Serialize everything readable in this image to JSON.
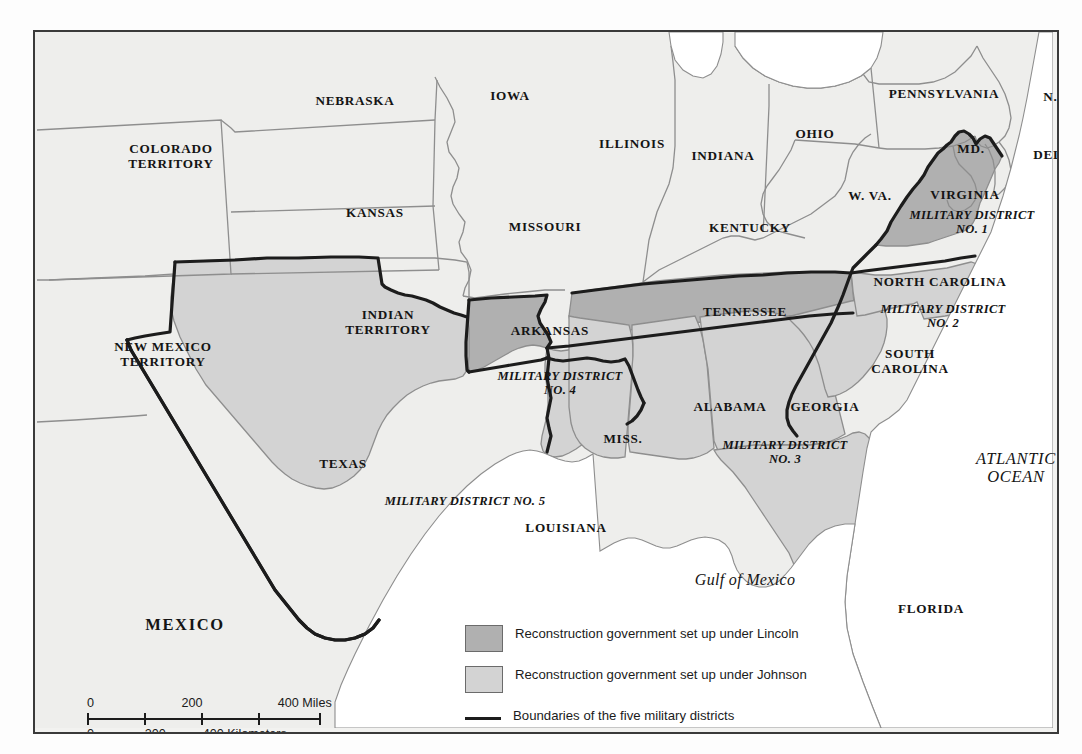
{
  "map": {
    "regions": [
      {
        "name": "colorado-territory",
        "label": "COLORADO\nTERRITORY",
        "x": 66,
        "y": 110,
        "w": 140,
        "cls": "st"
      },
      {
        "name": "nebraska",
        "label": "NEBRASKA",
        "x": 260,
        "y": 62,
        "w": 120,
        "cls": "st"
      },
      {
        "name": "iowa",
        "label": "IOWA",
        "x": 435,
        "y": 57,
        "w": 80,
        "cls": "st"
      },
      {
        "name": "kansas",
        "label": "KANSAS",
        "x": 288,
        "y": 174,
        "w": 104,
        "cls": "st"
      },
      {
        "name": "missouri",
        "label": "MISSOURI",
        "x": 455,
        "y": 188,
        "w": 110,
        "cls": "st"
      },
      {
        "name": "illinois",
        "label": "ILLINOIS",
        "x": 545,
        "y": 105,
        "w": 104,
        "cls": "st"
      },
      {
        "name": "indiana",
        "label": "INDIANA",
        "x": 636,
        "y": 117,
        "w": 104,
        "cls": "st"
      },
      {
        "name": "ohio",
        "x": 740,
        "y": 95,
        "label": "OHIO",
        "w": 80,
        "cls": "st"
      },
      {
        "name": "pennsylvania",
        "label": "PENNSYLVANIA",
        "x": 834,
        "y": 55,
        "w": 150,
        "cls": "st"
      },
      {
        "name": "new-jersey",
        "label": "N.J.",
        "x": 995,
        "y": 58,
        "w": 52,
        "cls": "st"
      },
      {
        "name": "maryland",
        "label": "MD.",
        "x": 910,
        "y": 110,
        "w": 52,
        "cls": "st"
      },
      {
        "name": "delaware",
        "label": "DEL.",
        "x": 988,
        "y": 116,
        "w": 54,
        "cls": "st"
      },
      {
        "name": "west-virginia",
        "label": "W. VA.",
        "x": 800,
        "y": 157,
        "w": 70,
        "cls": "st"
      },
      {
        "name": "virginia",
        "label": "VIRGINIA",
        "x": 880,
        "y": 156,
        "w": 100,
        "cls": "st"
      },
      {
        "name": "kentucky",
        "label": "KENTUCKY",
        "x": 655,
        "y": 189,
        "w": 120,
        "cls": "st"
      },
      {
        "name": "new-mexico-territory",
        "label": "NEW MEXICO\nTERRITORY",
        "x": 58,
        "y": 308,
        "w": 140,
        "cls": "st"
      },
      {
        "name": "indian-territory",
        "label": "INDIAN\nTERRITORY",
        "x": 288,
        "y": 276,
        "w": 130,
        "cls": "st"
      },
      {
        "name": "arkansas",
        "label": "ARKANSAS",
        "x": 455,
        "y": 292,
        "w": 120,
        "cls": "st"
      },
      {
        "name": "tennessee",
        "label": "TENNESSEE",
        "x": 640,
        "y": 273,
        "w": 140,
        "cls": "st"
      },
      {
        "name": "north-carolina",
        "label": "NORTH CAROLINA",
        "x": 820,
        "y": 243,
        "w": 170,
        "cls": "st"
      },
      {
        "name": "south-carolina",
        "label": "SOUTH\nCAROLINA",
        "x": 820,
        "y": 315,
        "w": 110,
        "cls": "st"
      },
      {
        "name": "texas",
        "label": "TEXAS",
        "x": 260,
        "y": 425,
        "w": 96,
        "cls": "st"
      },
      {
        "name": "louisiana",
        "label": "LOUISIANA",
        "x": 470,
        "y": 489,
        "w": 122,
        "cls": "st"
      },
      {
        "name": "mississippi",
        "label": "MISS.",
        "x": 555,
        "y": 400,
        "w": 66,
        "cls": "st"
      },
      {
        "name": "alabama",
        "label": "ALABAMA",
        "x": 640,
        "y": 368,
        "w": 110,
        "cls": "st"
      },
      {
        "name": "georgia",
        "label": "GEORGIA",
        "x": 738,
        "y": 368,
        "w": 104,
        "cls": "st"
      },
      {
        "name": "florida",
        "label": "FLORIDA",
        "x": 845,
        "y": 570,
        "w": 102,
        "cls": "st"
      }
    ],
    "districts": [
      {
        "name": "military-district-1",
        "label": "MILITARY DISTRICT\nNO. 1",
        "x": 872,
        "y": 176,
        "w": 130
      },
      {
        "name": "military-district-2",
        "label": "MILITARY DISTRICT\nNO. 2",
        "x": 838,
        "y": 270,
        "w": 140
      },
      {
        "name": "military-district-3",
        "label": "MILITARY DISTRICT\nNO. 3",
        "x": 675,
        "y": 406,
        "w": 150
      },
      {
        "name": "military-district-4",
        "label": "MILITARY DISTRICT\nNO. 4",
        "x": 455,
        "y": 337,
        "w": 140
      },
      {
        "name": "military-district-5",
        "label": "MILITARY DISTRICT NO. 5",
        "x": 310,
        "y": 462,
        "w": 240
      }
    ],
    "water": [
      {
        "name": "atlantic-ocean-label",
        "label": "ATLANTIC\nOCEAN",
        "x": 916,
        "y": 418,
        "w": 130,
        "cls": "ocean"
      },
      {
        "name": "gulf-of-mexico-label",
        "label": "Gulf of Mexico",
        "x": 630,
        "y": 539,
        "w": 160,
        "cls": "gulf"
      }
    ],
    "countries": [
      {
        "name": "mexico-label",
        "label": "MEXICO",
        "x": 90,
        "y": 584,
        "w": 120,
        "cls": "mex"
      }
    ]
  },
  "legend": {
    "items": [
      {
        "name": "legend-lincoln",
        "swatch": "dark",
        "text": "Reconstruction government set up\nunder Lincoln"
      },
      {
        "name": "legend-johnson",
        "swatch": "light",
        "text": "Reconstruction government set up under Johnson"
      },
      {
        "name": "legend-district-boundary",
        "swatch": "line",
        "text": "Boundaries of the five military districts"
      }
    ]
  },
  "scale": {
    "miles": {
      "ticks": [
        "0",
        "200",
        "400 Miles"
      ],
      "positions": [
        0,
        46.5,
        94
      ]
    },
    "kilometers": {
      "ticks": [
        "0",
        "200",
        "400 Kilometers"
      ],
      "positions": [
        0,
        28.5,
        57
      ]
    }
  },
  "colors": {
    "lincoln_fill": "#b0b0b0",
    "johnson_fill": "#d3d3d3",
    "land_fill": "#eeeeec",
    "water_fill": "#ffffff",
    "district_boundary": "#1c1c1c",
    "state_border": "#8e8e8e",
    "frame": "#3a3a3a"
  }
}
